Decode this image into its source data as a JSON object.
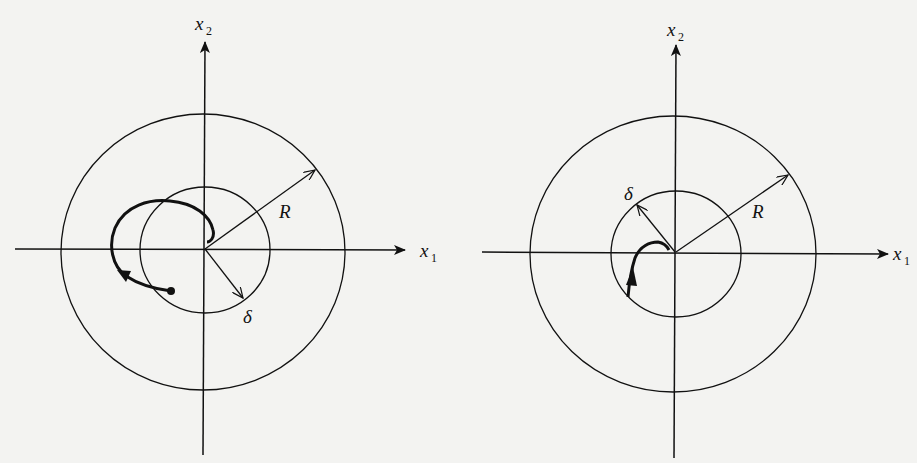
{
  "figure": {
    "left_panel": {
      "x_axis_label": "x",
      "x_axis_sub": "1",
      "y_axis_label": "x",
      "y_axis_sub": "2",
      "outer_circle_label": "R",
      "inner_circle_label": "δ",
      "description": "Trajectory starting inside δ-ball leaves the δ-ball but stays within the R-ball"
    },
    "right_panel": {
      "x_axis_label": "x",
      "x_axis_sub": "1",
      "y_axis_label": "x",
      "y_axis_sub": "2",
      "outer_circle_label": "R",
      "inner_circle_label": "δ",
      "description": "Trajectory starting on δ-ball boundary converges toward the origin"
    }
  },
  "colors": {
    "background": "#f3f3f1",
    "ink": "#111111"
  }
}
